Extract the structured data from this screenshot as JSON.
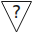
{
  "symbol": {
    "shape": "inverted-triangle",
    "glyph": "?",
    "meaning": "unknown",
    "stroke_color": "#1a1a1a",
    "fill_color": "#ffffff"
  }
}
